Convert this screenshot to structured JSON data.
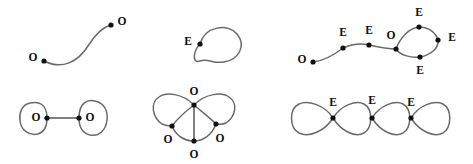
{
  "figure": {
    "width": 473,
    "height": 164,
    "background_color": "#ffffff",
    "edge_color": "#6a6a6a",
    "vertex_color": "#111111",
    "label_color": "#111111"
  },
  "panels": [
    {
      "id": "panel-top-left",
      "name": "open-path-two-odd",
      "position": "top-left",
      "vertices": [
        {
          "label": "O",
          "x": 44,
          "y": 61,
          "label_x": 33,
          "label_y": 58
        },
        {
          "label": "O",
          "x": 111,
          "y": 25,
          "label_x": 122,
          "label_y": 22
        }
      ],
      "edges": [
        {
          "type": "curve",
          "path": "M 44 61 C 62 70 78 62 88 46 C 96 33 103 27 111 25"
        }
      ]
    },
    {
      "id": "panel-top-middle",
      "name": "single-loop-one-even",
      "position": "top-middle",
      "vertices": [
        {
          "label": "E",
          "x": 200,
          "y": 44,
          "label_x": 188,
          "label_y": 42
        }
      ],
      "edges": [
        {
          "type": "loop",
          "path": "M 200 44 C 205 26 228 23 237 34 C 247 46 238 60 224 62 C 212 64 209 58 200 61 C 191 64 194 50 200 44 Z"
        }
      ]
    },
    {
      "id": "panel-top-right",
      "name": "path-with-loop-two-odd",
      "position": "top-right",
      "vertices": [
        {
          "label": "O",
          "x": 313,
          "y": 62,
          "label_x": 302,
          "label_y": 60
        },
        {
          "label": "E",
          "x": 343,
          "y": 48,
          "label_x": 343,
          "label_y": 33
        },
        {
          "label": "E",
          "x": 369,
          "y": 45,
          "label_x": 369,
          "label_y": 31
        },
        {
          "label": "O",
          "x": 396,
          "y": 49,
          "label_x": 391,
          "label_y": 36
        },
        {
          "label": "E",
          "x": 419,
          "y": 27,
          "label_x": 419,
          "label_y": 13
        },
        {
          "label": "E",
          "x": 438,
          "y": 40,
          "label_x": 452,
          "label_y": 38
        },
        {
          "label": "E",
          "x": 420,
          "y": 57,
          "label_x": 420,
          "label_y": 71
        }
      ],
      "edges": [
        {
          "type": "curve",
          "path": "M 313 62 C 323 61 334 55 343 48"
        },
        {
          "type": "curve",
          "path": "M 343 48 C 352 44 361 43 369 45"
        },
        {
          "type": "curve",
          "path": "M 369 45 C 378 47 388 49 396 49"
        },
        {
          "type": "curve",
          "path": "M 396 49 C 400 38 409 28 419 27"
        },
        {
          "type": "curve",
          "path": "M 419 27 C 429 27 436 33 438 40"
        },
        {
          "type": "curve",
          "path": "M 438 40 C 439 48 431 55 420 57"
        },
        {
          "type": "curve",
          "path": "M 420 57 C 410 58 400 55 396 49"
        }
      ]
    },
    {
      "id": "panel-bottom-left",
      "name": "two-loops-bridge-two-odd",
      "position": "bottom-left",
      "vertices": [
        {
          "label": "O",
          "x": 47,
          "y": 118,
          "label_x": 36,
          "label_y": 118
        },
        {
          "label": "O",
          "x": 79,
          "y": 118,
          "label_x": 90,
          "label_y": 118
        }
      ],
      "edges": [
        {
          "type": "loop",
          "path": "M 47 118 C 47 104 39 101 30 103 C 21 105 19 114 20 121 C 21 130 29 136 38 134 C 45 132 47 126 47 118 Z"
        },
        {
          "type": "loop",
          "path": "M 79 118 C 79 103 87 99 95 101 C 105 103 108 112 107 120 C 106 130 99 137 90 135 C 82 133 79 127 79 118 Z"
        },
        {
          "type": "straight",
          "path": "M 47 118 L 79 118"
        }
      ]
    },
    {
      "id": "panel-bottom-middle",
      "name": "double-loop-four-odd",
      "position": "bottom-middle",
      "vertices": [
        {
          "label": "O",
          "x": 194,
          "y": 105,
          "label_x": 194,
          "label_y": 92
        },
        {
          "label": "O",
          "x": 172,
          "y": 126,
          "label_x": 168,
          "label_y": 140
        },
        {
          "label": "O",
          "x": 216,
          "y": 124,
          "label_x": 220,
          "label_y": 139
        },
        {
          "label": "O",
          "x": 194,
          "y": 141,
          "label_x": 194,
          "label_y": 155
        }
      ],
      "edges": [
        {
          "type": "curve",
          "path": "M 194 105 C 182 93 166 92 159 97 C 150 103 152 117 162 124 C 166 126 169 126 172 126"
        },
        {
          "type": "curve",
          "path": "M 172 126 C 178 118 186 111 194 105"
        },
        {
          "type": "curve",
          "path": "M 194 105 C 206 93 222 92 229 97 C 238 103 236 116 226 123 C 222 125 219 124 216 124"
        },
        {
          "type": "curve",
          "path": "M 216 124 C 209 117 201 111 194 105"
        },
        {
          "type": "curve",
          "path": "M 172 126 C 176 136 185 141 194 141"
        },
        {
          "type": "curve",
          "path": "M 216 124 C 212 135 203 141 194 141"
        },
        {
          "type": "straight",
          "path": "M 194 105 L 194 141"
        }
      ]
    },
    {
      "id": "panel-bottom-right",
      "name": "four-loop-chain-three-even",
      "position": "bottom-right",
      "vertices": [
        {
          "label": "E",
          "x": 333,
          "y": 118,
          "label_x": 333,
          "label_y": 103
        },
        {
          "label": "E",
          "x": 372,
          "y": 118,
          "label_x": 372,
          "label_y": 101
        },
        {
          "label": "E",
          "x": 411,
          "y": 118,
          "label_x": 411,
          "label_y": 103
        }
      ],
      "edges": [
        {
          "type": "loop",
          "path": "M 333 118 C 325 105 308 100 299 104 C 289 109 289 127 299 133 C 309 138 325 131 333 118 Z"
        },
        {
          "type": "loop",
          "path": "M 333 118 C 341 105 356 100 364 104 C 373 109 373 127 364 133 C 355 138 341 131 333 118 Z"
        },
        {
          "type": "loop",
          "path": "M 372 118 C 380 105 395 100 403 104 C 412 109 412 127 403 133 C 394 138 380 131 372 118 Z"
        },
        {
          "type": "loop",
          "path": "M 411 118 C 419 105 434 100 443 104 C 452 109 452 127 443 133 C 434 138 419 131 411 118 Z"
        }
      ]
    }
  ],
  "legend": {
    "odd_symbol": "O",
    "even_symbol": "E"
  }
}
